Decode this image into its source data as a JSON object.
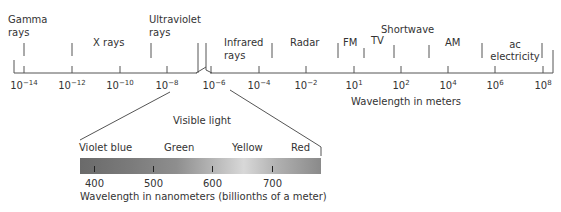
{
  "diagram": {
    "main_axis": {
      "label": "Wavelength in meters",
      "ticks": [
        {
          "base": "10",
          "exp": "−14"
        },
        {
          "base": "10",
          "exp": "−12"
        },
        {
          "base": "10",
          "exp": "−10"
        },
        {
          "base": "10",
          "exp": "−8"
        },
        {
          "base": "10",
          "exp": "−6"
        },
        {
          "base": "10",
          "exp": "−4"
        },
        {
          "base": "10",
          "exp": "−2"
        },
        {
          "base": "10",
          "exp": "1"
        },
        {
          "base": "10",
          "exp": "2"
        },
        {
          "base": "10",
          "exp": "4"
        },
        {
          "base": "10",
          "exp": "6"
        },
        {
          "base": "10",
          "exp": "8"
        }
      ]
    },
    "regions": {
      "gamma_l1": "Gamma",
      "gamma_l2": "rays",
      "xrays": "X rays",
      "uv_l1": "Ultraviolet",
      "uv_l2": "rays",
      "ir_l1": "Infrared",
      "ir_l2": "rays",
      "radar": "Radar",
      "fm": "FM",
      "tv": "TV",
      "shortwave": "Shortwave",
      "am": "AM",
      "ac_l1": "ac",
      "ac_l2": "electricity"
    },
    "visible": {
      "title": "Visible light",
      "colors": [
        "Violet blue",
        "Green",
        "Yellow",
        "Red"
      ],
      "ticks": [
        "400",
        "500",
        "600",
        "700"
      ],
      "axis_label": "Wavelength in nanometers (billionths of a meter)"
    }
  }
}
